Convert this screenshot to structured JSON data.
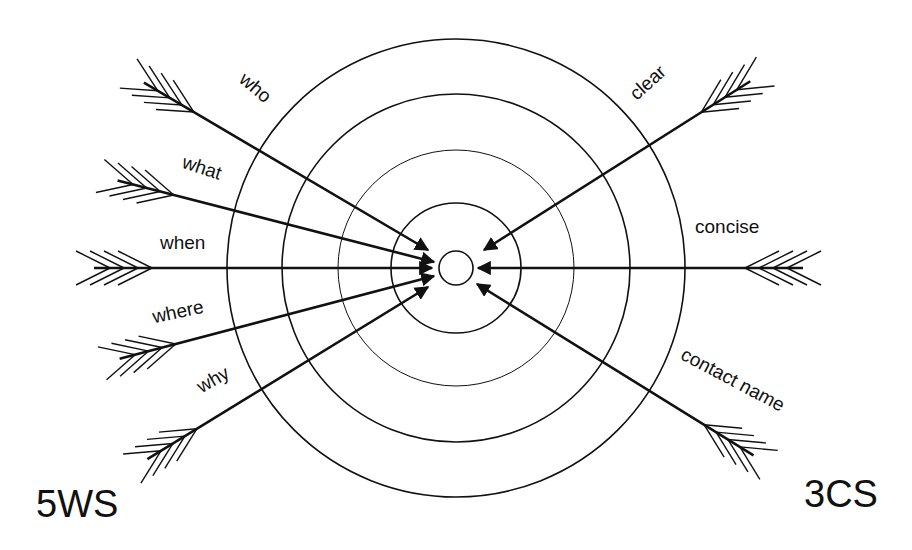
{
  "diagram": {
    "center": {
      "x": 456,
      "y": 268
    },
    "rings": [
      {
        "r": 17,
        "stroke_width": 1.6
      },
      {
        "r": 65,
        "stroke_width": 1.6
      },
      {
        "r": 118,
        "stroke_width": 1.0
      },
      {
        "r": 174,
        "stroke_width": 1.6
      },
      {
        "r": 229,
        "stroke_width": 1.6
      }
    ],
    "stroke_color": "#111111",
    "left_group": {
      "label": "5WS",
      "arrows": [
        {
          "label": "who",
          "tail": [
            187,
            108
          ],
          "head": [
            428,
            250
          ]
        },
        {
          "label": "what",
          "tail": [
            166,
            193
          ],
          "head": [
            434,
            262
          ]
        },
        {
          "label": "when",
          "tail": [
            144,
            268
          ],
          "head": [
            432,
            268
          ]
        },
        {
          "label": "where",
          "tail": [
            168,
            346
          ],
          "head": [
            434,
            276
          ]
        },
        {
          "label": "why",
          "tail": [
            190,
            433
          ],
          "head": [
            428,
            287
          ]
        }
      ]
    },
    "right_group": {
      "label": "3CS",
      "arrows": [
        {
          "label": "clear",
          "tail": [
            708,
            108
          ],
          "head": [
            484,
            250
          ]
        },
        {
          "label": "concise",
          "tail": [
            753,
            268
          ],
          "head": [
            478,
            268
          ]
        },
        {
          "label": "contact name",
          "tail": [
            711,
            429
          ],
          "head": [
            477,
            284
          ]
        }
      ]
    }
  },
  "labels": {
    "who": "who",
    "what": "what",
    "when": "when",
    "where": "where",
    "why": "why",
    "clear": "clear",
    "concise": "concise",
    "contact_name": "contact name",
    "left_group": "5WS",
    "right_group": "3CS"
  }
}
